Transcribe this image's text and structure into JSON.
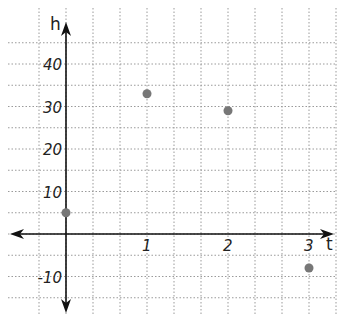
{
  "chart_data": {
    "type": "scatter",
    "title": "",
    "xlabel": "t",
    "ylabel": "h",
    "x": [
      0,
      1,
      2,
      3
    ],
    "y": [
      5,
      33,
      29,
      -8
    ],
    "xticks": [
      "1",
      "2",
      "3"
    ],
    "yticks": [
      "40",
      "30",
      "20",
      "10",
      "-10"
    ],
    "xlim": [
      -0.67,
      3.33
    ],
    "ylim": [
      -15,
      50
    ],
    "grid": true,
    "grid_step_x": 0.3333,
    "grid_step_y": 5,
    "point_color": "#777777"
  }
}
